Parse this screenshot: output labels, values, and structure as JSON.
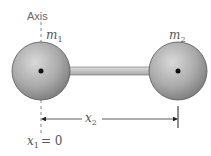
{
  "diagram": {
    "axis_label": "Axis",
    "mass1": {
      "symbol": "m",
      "subscript": "1"
    },
    "mass2": {
      "symbol": "m",
      "subscript": "2"
    },
    "distance": {
      "symbol": "x",
      "subscript": "2"
    },
    "origin": {
      "symbol": "x",
      "subscript": "1",
      "equals": "= 0"
    },
    "colors": {
      "sphere_light": "#cfcfcf",
      "sphere_dark": "#8a8a8a",
      "rod": "#c4c4c4",
      "line": "#333333",
      "text": "#555555"
    }
  }
}
